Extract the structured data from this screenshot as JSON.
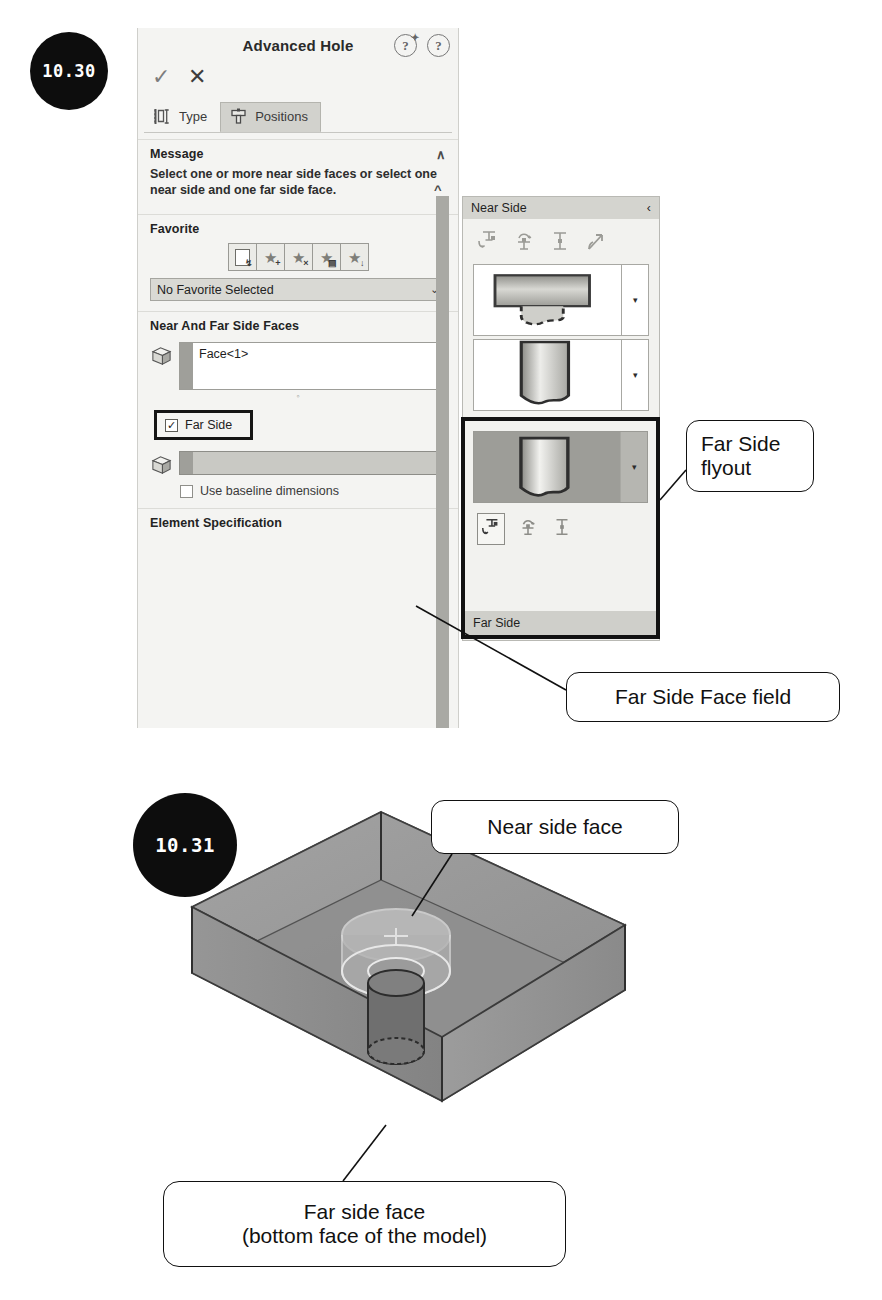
{
  "figures": [
    {
      "id": "10.30",
      "label": "10.30"
    },
    {
      "id": "10.31",
      "label": "10.31"
    }
  ],
  "property_manager": {
    "title": "Advanced Hole",
    "help_icons": [
      {
        "name": "help-whats-new-icon",
        "glyph": "?"
      },
      {
        "name": "help-icon",
        "glyph": "?"
      }
    ],
    "confirm": {
      "ok_glyph": "✓",
      "cancel_glyph": "✕"
    },
    "tabs": [
      {
        "label": "Type",
        "active": false
      },
      {
        "label": "Positions",
        "active": true
      }
    ],
    "sections": {
      "message": {
        "title": "Message",
        "collapse_glyph": "∧",
        "body": "Select one or more near side faces or select one near side and one far side face."
      },
      "favorite": {
        "title": "Favorite",
        "collapse_glyph": "∧",
        "toolbar": [
          {
            "name": "apply-default-favorite-icon"
          },
          {
            "name": "add-favorite-icon"
          },
          {
            "name": "delete-favorite-icon"
          },
          {
            "name": "save-favorite-icon"
          },
          {
            "name": "load-favorite-icon"
          }
        ],
        "combo_value": "No Favorite Selected",
        "combo_chevron": "⌄"
      },
      "near_and_far": {
        "title": "Near And Far Side Faces",
        "collapse_glyph": "∧",
        "near_face_value": "Face<1>",
        "far_side_checkbox": {
          "label": "Far Side",
          "checked": true,
          "check_glyph": "✓"
        },
        "far_face_value": "",
        "baseline_checkbox": {
          "label": "Use baseline dimensions",
          "checked": false
        }
      },
      "element_specification": {
        "title": "Element Specification",
        "collapse_glyph": "∧"
      }
    }
  },
  "flyout": {
    "title": "Near Side",
    "collapse_glyph": "‹",
    "tool_icons": [
      {
        "name": "counterbore-icon"
      },
      {
        "name": "countersink-icon"
      },
      {
        "name": "hole-icon"
      },
      {
        "name": "straight-tap-icon"
      }
    ],
    "cards": [
      {
        "name": "counterbore-preview-card",
        "dropdown_glyph": "▾"
      },
      {
        "name": "hole-preview-card",
        "dropdown_glyph": "▾"
      }
    ],
    "far_side_block": {
      "card": {
        "name": "far-side-preview-card",
        "dropdown_glyph": "▾"
      },
      "tool_icons": [
        {
          "name": "far-side-counterbore-icon",
          "selected": true
        },
        {
          "name": "far-side-countersink-icon",
          "selected": false
        },
        {
          "name": "far-side-hole-icon",
          "selected": false
        }
      ],
      "label": "Far Side"
    }
  },
  "callouts": [
    {
      "id": "far-side-flyout",
      "lines": [
        "Far Side",
        "flyout"
      ]
    },
    {
      "id": "far-side-face-field",
      "lines": [
        "Far Side Face field"
      ]
    },
    {
      "id": "near-side-face",
      "lines": [
        "Near side face"
      ]
    },
    {
      "id": "far-side-face",
      "lines": [
        "Far side face",
        "(bottom face of the model)"
      ]
    }
  ],
  "colors": {
    "panel_bg": "#f4f4f2",
    "header_bg": "#d4d4cf",
    "accent_dark": "#121212",
    "field_disabled": "#c9c9c4",
    "model_top": "#9a9a9a",
    "model_front": "#8b8b8b",
    "model_side": "#a2a2a2"
  }
}
